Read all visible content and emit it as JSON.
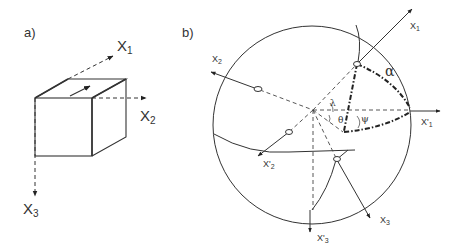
{
  "panel_a": {
    "label": "a)",
    "axes": {
      "x1": {
        "name": "X",
        "sub": "1"
      },
      "x2": {
        "name": "X",
        "sub": "2"
      },
      "x3": {
        "name": "X",
        "sub": "3"
      }
    }
  },
  "panel_b": {
    "label": "b)",
    "axes": {
      "x1": {
        "name": "X",
        "sub": "1"
      },
      "x2": {
        "name": "X",
        "sub": "2"
      },
      "x3": {
        "name": "X",
        "sub": "3"
      },
      "x1p": {
        "name": "X'",
        "sub": "1"
      },
      "x2p": {
        "name": "X'",
        "sub": "2"
      },
      "x3p": {
        "name": "X'",
        "sub": "3"
      }
    },
    "angles": {
      "alpha": "α",
      "lambda": "λ",
      "theta": "θ",
      "psi": "ψ"
    }
  },
  "colors": {
    "line": "#333333",
    "background": "#ffffff"
  }
}
